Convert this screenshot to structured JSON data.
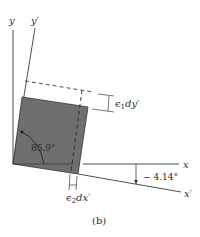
{
  "figure": {
    "caption": "(b)",
    "axes": {
      "y_label": "y",
      "y_prime_label": "y′",
      "x_label": "x",
      "x_prime_label": "x′"
    },
    "annotations": {
      "angle_inner": "85.9°",
      "rotation_angle": "− 4.14°",
      "strain_1": "ϵ",
      "strain_1_sub": "1",
      "strain_1_rest": "dy′",
      "strain_2": "ϵ",
      "strain_2_sub": "2",
      "strain_2_rest": "dx′"
    },
    "colors": {
      "element_fill": "#6f6f6f",
      "line": "#3a3a3a"
    }
  }
}
